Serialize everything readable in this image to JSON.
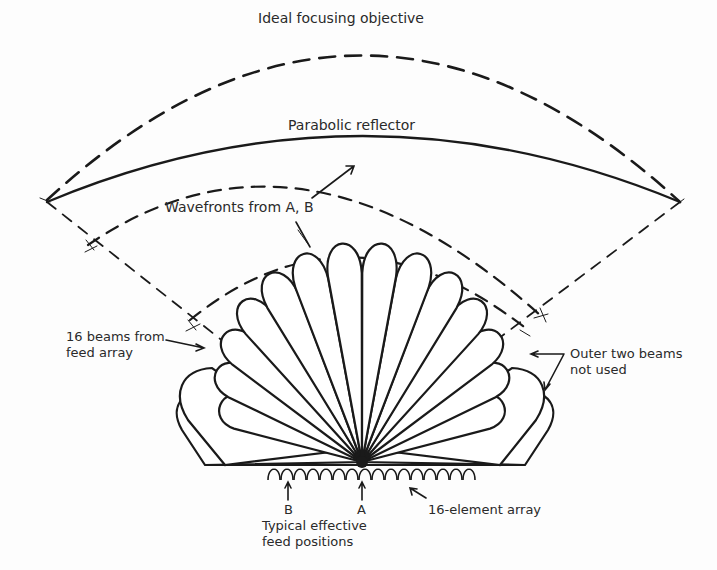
{
  "diagram": {
    "type": "multibeam feed array with parabolic reflector",
    "labels": {
      "ideal_objective": "Ideal focusing objective",
      "parabolic_reflector": "Parabolic reflector",
      "wavefronts": "Wavefronts from A, B",
      "beams_line1": "16 beams from",
      "beams_line2": "feed array",
      "outer_line1": "Outer two beams",
      "outer_line2": "not used",
      "point_b": "B",
      "point_a": "A",
      "array": "16-element array",
      "feed_line1": "Typical effective",
      "feed_line2": "feed positions"
    },
    "beam_count": 16,
    "array_element_count": 16,
    "colors": {
      "ink": "#1a1a1a",
      "background": "#fdfdfd"
    }
  }
}
